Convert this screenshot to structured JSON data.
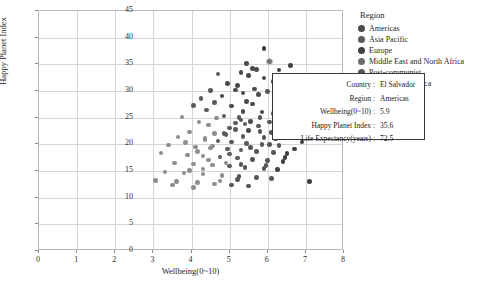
{
  "chart_data": {
    "type": "scatter",
    "title": "",
    "xlabel": "Wellbeing(0~10)",
    "ylabel": "Happy Planet Index",
    "xlim": [
      0,
      8
    ],
    "ylim": [
      0,
      45
    ],
    "xticks": [
      "0",
      "1",
      "2",
      "3",
      "4",
      "5",
      "6",
      "7",
      "8"
    ],
    "yticks": [
      "0",
      "5",
      "10",
      "15",
      "20",
      "25",
      "30",
      "35",
      "40",
      "45"
    ],
    "grid": true,
    "legend_position": "top-right",
    "legend_title": "Region",
    "series": [
      {
        "name": "Americas",
        "color": "#4a4a4a"
      },
      {
        "name": "Asia Pacific",
        "color": "#5a5a5a"
      },
      {
        "name": "Europe",
        "color": "#3f3f3f"
      },
      {
        "name": "Middle East and North Africa",
        "color": "#6b6b6b"
      },
      {
        "name": "Post-communist",
        "color": "#555555"
      },
      {
        "name": "Sub Saharan Africa",
        "color": "#8d8d8d"
      }
    ],
    "points": [
      {
        "x": 5.9,
        "y": 38.0,
        "s": 2
      },
      {
        "x": 6.6,
        "y": 34.8,
        "s": 2
      },
      {
        "x": 5.6,
        "y": 34.2,
        "s": 0
      },
      {
        "x": 5.7,
        "y": 34.0,
        "s": 0
      },
      {
        "x": 5.3,
        "y": 33.5,
        "s": 0
      },
      {
        "x": 6.9,
        "y": 32.7,
        "s": 2
      },
      {
        "x": 6.7,
        "y": 32.2,
        "s": 2
      },
      {
        "x": 5.2,
        "y": 31.0,
        "s": 0
      },
      {
        "x": 5.15,
        "y": 30.2,
        "s": 0
      },
      {
        "x": 6.0,
        "y": 29.9,
        "s": 4
      },
      {
        "x": 5.75,
        "y": 29.3,
        "s": 0
      },
      {
        "x": 6.8,
        "y": 29.6,
        "s": 2
      },
      {
        "x": 6.3,
        "y": 28.9,
        "s": 2
      },
      {
        "x": 5.45,
        "y": 28.0,
        "s": 0
      },
      {
        "x": 6.2,
        "y": 27.1,
        "s": 2
      },
      {
        "x": 6.55,
        "y": 26.8,
        "s": 2
      },
      {
        "x": 4.85,
        "y": 25.3,
        "s": 1
      },
      {
        "x": 5.35,
        "y": 26.2,
        "s": 0
      },
      {
        "x": 6.45,
        "y": 26.0,
        "s": 2
      },
      {
        "x": 6.35,
        "y": 25.6,
        "s": 2
      },
      {
        "x": 6.6,
        "y": 25.2,
        "s": 2
      },
      {
        "x": 6.75,
        "y": 25.0,
        "s": 2
      },
      {
        "x": 5.25,
        "y": 25.0,
        "s": 1
      },
      {
        "x": 5.3,
        "y": 24.6,
        "s": 1
      },
      {
        "x": 5.55,
        "y": 24.3,
        "s": 0
      },
      {
        "x": 6.05,
        "y": 24.2,
        "s": 4
      },
      {
        "x": 6.85,
        "y": 23.9,
        "s": 2
      },
      {
        "x": 5.0,
        "y": 23.1,
        "s": 1
      },
      {
        "x": 5.15,
        "y": 22.8,
        "s": 1
      },
      {
        "x": 5.5,
        "y": 22.6,
        "s": 0
      },
      {
        "x": 5.8,
        "y": 22.4,
        "s": 4
      },
      {
        "x": 6.1,
        "y": 22.2,
        "s": 4
      },
      {
        "x": 4.6,
        "y": 22.0,
        "s": 5
      },
      {
        "x": 4.9,
        "y": 21.8,
        "s": 1
      },
      {
        "x": 5.35,
        "y": 21.5,
        "s": 1
      },
      {
        "x": 5.9,
        "y": 21.3,
        "s": 4
      },
      {
        "x": 6.2,
        "y": 21.0,
        "s": 4
      },
      {
        "x": 4.35,
        "y": 20.8,
        "s": 5
      },
      {
        "x": 4.7,
        "y": 20.6,
        "s": 1
      },
      {
        "x": 5.05,
        "y": 20.4,
        "s": 1
      },
      {
        "x": 5.45,
        "y": 20.2,
        "s": 1
      },
      {
        "x": 5.85,
        "y": 20.0,
        "s": 4
      },
      {
        "x": 6.3,
        "y": 19.8,
        "s": 4
      },
      {
        "x": 4.1,
        "y": 19.5,
        "s": 5
      },
      {
        "x": 4.5,
        "y": 19.3,
        "s": 5
      },
      {
        "x": 4.95,
        "y": 19.1,
        "s": 1
      },
      {
        "x": 5.3,
        "y": 18.9,
        "s": 1
      },
      {
        "x": 5.7,
        "y": 18.7,
        "s": 4
      },
      {
        "x": 6.15,
        "y": 18.5,
        "s": 4
      },
      {
        "x": 6.5,
        "y": 18.3,
        "s": 2
      },
      {
        "x": 3.9,
        "y": 18.0,
        "s": 5
      },
      {
        "x": 4.3,
        "y": 17.8,
        "s": 5
      },
      {
        "x": 4.75,
        "y": 17.6,
        "s": 1
      },
      {
        "x": 5.2,
        "y": 17.4,
        "s": 1
      },
      {
        "x": 5.6,
        "y": 17.2,
        "s": 4
      },
      {
        "x": 6.0,
        "y": 17.0,
        "s": 4
      },
      {
        "x": 6.4,
        "y": 16.8,
        "s": 2
      },
      {
        "x": 3.55,
        "y": 16.5,
        "s": 5
      },
      {
        "x": 4.05,
        "y": 16.3,
        "s": 5
      },
      {
        "x": 4.55,
        "y": 16.1,
        "s": 5
      },
      {
        "x": 5.0,
        "y": 15.9,
        "s": 1
      },
      {
        "x": 5.4,
        "y": 15.7,
        "s": 4
      },
      {
        "x": 5.9,
        "y": 15.5,
        "s": 4
      },
      {
        "x": 6.25,
        "y": 15.3,
        "s": 2
      },
      {
        "x": 7.1,
        "y": 13.0,
        "s": 2
      },
      {
        "x": 3.3,
        "y": 14.8,
        "s": 5
      },
      {
        "x": 3.8,
        "y": 14.6,
        "s": 5
      },
      {
        "x": 4.3,
        "y": 14.4,
        "s": 5
      },
      {
        "x": 4.8,
        "y": 14.2,
        "s": 5
      },
      {
        "x": 5.25,
        "y": 14.0,
        "s": 4
      },
      {
        "x": 5.7,
        "y": 13.8,
        "s": 4
      },
      {
        "x": 6.1,
        "y": 13.6,
        "s": 4
      },
      {
        "x": 3.05,
        "y": 13.2,
        "s": 5
      },
      {
        "x": 3.6,
        "y": 13.0,
        "s": 5
      },
      {
        "x": 4.15,
        "y": 12.8,
        "s": 5
      },
      {
        "x": 4.6,
        "y": 12.6,
        "s": 5
      },
      {
        "x": 5.05,
        "y": 12.4,
        "s": 4
      },
      {
        "x": 5.5,
        "y": 12.2,
        "s": 4
      },
      {
        "x": 4.45,
        "y": 23.6,
        "s": 5
      },
      {
        "x": 4.2,
        "y": 24.2,
        "s": 5
      },
      {
        "x": 4.65,
        "y": 24.9,
        "s": 5
      },
      {
        "x": 4.4,
        "y": 26.4,
        "s": 1
      },
      {
        "x": 4.05,
        "y": 27.3,
        "s": 1
      },
      {
        "x": 3.75,
        "y": 25.1,
        "s": 5
      },
      {
        "x": 3.95,
        "y": 22.3,
        "s": 5
      },
      {
        "x": 3.65,
        "y": 21.4,
        "s": 5
      },
      {
        "x": 4.25,
        "y": 28.6,
        "s": 1
      },
      {
        "x": 4.8,
        "y": 29.1,
        "s": 0
      },
      {
        "x": 4.95,
        "y": 31.4,
        "s": 0
      },
      {
        "x": 4.5,
        "y": 30.1,
        "s": 1
      },
      {
        "x": 5.05,
        "y": 27.2,
        "s": 0
      },
      {
        "x": 5.6,
        "y": 27.6,
        "s": 0
      },
      {
        "x": 5.85,
        "y": 26.1,
        "s": 0
      },
      {
        "x": 6.15,
        "y": 31.8,
        "s": 2
      },
      {
        "x": 6.45,
        "y": 30.8,
        "s": 2
      },
      {
        "x": 6.3,
        "y": 33.9,
        "s": 2
      },
      {
        "x": 6.05,
        "y": 35.6,
        "s": 0,
        "highlight": true
      },
      {
        "x": 5.45,
        "y": 35.2,
        "s": 0
      },
      {
        "x": 4.7,
        "y": 33.2,
        "s": 1
      },
      {
        "x": 5.9,
        "y": 32.4,
        "s": 0
      },
      {
        "x": 5.35,
        "y": 29.6,
        "s": 0
      },
      {
        "x": 4.6,
        "y": 27.8,
        "s": 1
      },
      {
        "x": 5.15,
        "y": 24.0,
        "s": 1
      },
      {
        "x": 4.35,
        "y": 21.1,
        "s": 5
      },
      {
        "x": 5.75,
        "y": 23.4,
        "s": 4
      },
      {
        "x": 6.6,
        "y": 22.0,
        "s": 2
      },
      {
        "x": 6.9,
        "y": 20.4,
        "s": 2
      },
      {
        "x": 6.7,
        "y": 19.1,
        "s": 2
      },
      {
        "x": 6.45,
        "y": 17.5,
        "s": 2
      },
      {
        "x": 3.4,
        "y": 19.9,
        "s": 5
      },
      {
        "x": 3.2,
        "y": 18.4,
        "s": 5
      },
      {
        "x": 3.85,
        "y": 20.3,
        "s": 5
      },
      {
        "x": 4.15,
        "y": 18.7,
        "s": 5
      },
      {
        "x": 4.45,
        "y": 17.1,
        "s": 5
      },
      {
        "x": 4.9,
        "y": 16.5,
        "s": 5
      },
      {
        "x": 5.3,
        "y": 16.2,
        "s": 4
      },
      {
        "x": 5.95,
        "y": 16.0,
        "s": 4
      },
      {
        "x": 6.25,
        "y": 23.0,
        "s": 2
      },
      {
        "x": 6.05,
        "y": 20.0,
        "s": 4
      },
      {
        "x": 5.55,
        "y": 19.4,
        "s": 4
      },
      {
        "x": 5.2,
        "y": 13.4,
        "s": 4
      },
      {
        "x": 4.75,
        "y": 13.1,
        "s": 5
      },
      {
        "x": 4.3,
        "y": 15.4,
        "s": 5
      },
      {
        "x": 3.95,
        "y": 15.1,
        "s": 5
      },
      {
        "x": 5.65,
        "y": 30.4,
        "s": 0
      },
      {
        "x": 5.5,
        "y": 32.9,
        "s": 0
      },
      {
        "x": 6.35,
        "y": 29.2,
        "s": 2
      },
      {
        "x": 6.75,
        "y": 27.4,
        "s": 2
      },
      {
        "x": 4.55,
        "y": 19.7,
        "s": 5
      },
      {
        "x": 5.0,
        "y": 18.2,
        "s": 1
      },
      {
        "x": 5.4,
        "y": 23.8,
        "s": 1
      },
      {
        "x": 4.85,
        "y": 22.0,
        "s": 1
      },
      {
        "x": 6.5,
        "y": 24.4,
        "s": 2
      },
      {
        "x": 6.15,
        "y": 25.8,
        "s": 4
      },
      {
        "x": 5.8,
        "y": 25.0,
        "s": 4
      },
      {
        "x": 3.5,
        "y": 12.4,
        "s": 5
      },
      {
        "x": 4.05,
        "y": 11.9,
        "s": 5
      }
    ]
  },
  "legend": {
    "title": "Region",
    "items": [
      {
        "label": "Americas"
      },
      {
        "label": "Asia Pacific"
      },
      {
        "label": "Europe"
      },
      {
        "label": "Middle East and North Africa"
      },
      {
        "label": "Post-communist"
      },
      {
        "label": "Sub Saharan Africa"
      }
    ]
  },
  "tooltip": {
    "rows": [
      {
        "key": "Country :",
        "value": "El Salvador"
      },
      {
        "key": "Region :",
        "value": "Americas"
      },
      {
        "key": "Wellbeing(0~10) :",
        "value": "5.9"
      },
      {
        "key": "Happy Planet Index :",
        "value": "35.6"
      },
      {
        "key": "Life Expectancy(years) :",
        "value": "72.5"
      }
    ]
  }
}
